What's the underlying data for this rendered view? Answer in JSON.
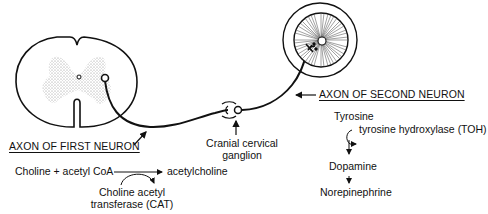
{
  "diagram": {
    "structures": {
      "spinal_cord": "spinal-cord-cross-section",
      "ganglion": "cranial-cervical-ganglion",
      "eye": "eye-iris"
    },
    "labels": {
      "axon_first": "AXON OF FIRST NEURON",
      "axon_second": "AXON OF SECOND NEURON",
      "ganglion_line1": "Cranial cervical",
      "ganglion_line2": "ganglion"
    },
    "acetylcholine_pathway": {
      "substrate": "Choline + acetyl CoA",
      "product": "acetylcholine",
      "enzyme_line1": "Choline acetyl",
      "enzyme_line2": "transferase (CAT)"
    },
    "catecholamine_pathway": {
      "step1": "Tyrosine",
      "enzyme": "tyrosine hydroxylase (TOH)",
      "step2": "Dopamine",
      "step3": "Norepinephrine"
    },
    "colors": {
      "line": "#111111",
      "stipple": "#9a9a9a",
      "background": "#ffffff"
    }
  }
}
